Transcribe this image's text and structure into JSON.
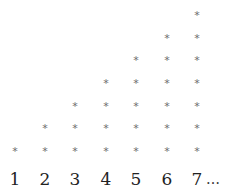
{
  "figure": {
    "symbol": "*",
    "ellipsis": "…",
    "columns": [
      {
        "label": "1",
        "count": 1
      },
      {
        "label": "2",
        "count": 2
      },
      {
        "label": "3",
        "count": 3
      },
      {
        "label": "4",
        "count": 4
      },
      {
        "label": "5",
        "count": 5
      },
      {
        "label": "6",
        "count": 6
      },
      {
        "label": "7",
        "count": 7
      }
    ],
    "colors": {
      "symbol": "#6e6e6e",
      "label": "#222222",
      "background": "#ffffff"
    }
  }
}
